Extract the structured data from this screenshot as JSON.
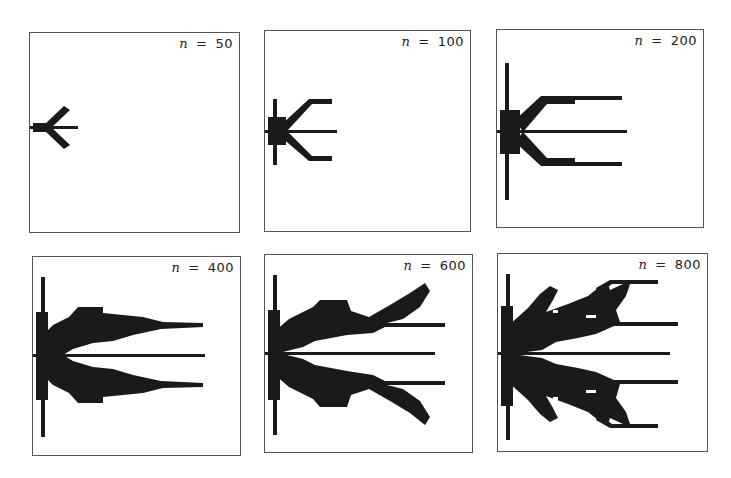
{
  "figure": {
    "ink_color": "#1a1a1a",
    "panels": [
      {
        "label_var": "n",
        "label_eq": "=",
        "label_value": "50",
        "box": {
          "x": 29,
          "y": 32,
          "w": 211,
          "h": 201
        },
        "shapes": [
          {
            "type": "rect",
            "x": 0,
            "y": 93,
            "w": 48,
            "h": 3
          },
          {
            "type": "rect",
            "x": 3,
            "y": 90,
            "w": 14,
            "h": 9
          },
          {
            "type": "poly",
            "pts": "14,92 34,73 40,77 20,96"
          },
          {
            "type": "poly",
            "pts": "14,97 34,116 40,112 20,93"
          }
        ]
      },
      {
        "label_var": "n",
        "label_eq": "=",
        "label_value": "100",
        "box": {
          "x": 264,
          "y": 30,
          "w": 207,
          "h": 202
        },
        "shapes": [
          {
            "type": "rect",
            "x": 0,
            "y": 99,
            "w": 72,
            "h": 3
          },
          {
            "type": "rect",
            "x": 8,
            "y": 68,
            "w": 4,
            "h": 66
          },
          {
            "type": "rect",
            "x": 3,
            "y": 86,
            "w": 18,
            "h": 28
          },
          {
            "type": "poly",
            "pts": "16,94 44,68 67,68 67,73 47,73 22,100"
          },
          {
            "type": "poly",
            "pts": "16,106 44,130 67,130 67,125 47,125 22,100"
          }
        ]
      },
      {
        "label_var": "n",
        "label_eq": "=",
        "label_value": "200",
        "box": {
          "x": 496,
          "y": 29,
          "w": 208,
          "h": 199
        },
        "shapes": [
          {
            "type": "rect",
            "x": 0,
            "y": 100,
            "w": 130,
            "h": 3
          },
          {
            "type": "rect",
            "x": 8,
            "y": 33,
            "w": 4,
            "h": 137
          },
          {
            "type": "rect",
            "x": 3,
            "y": 80,
            "w": 20,
            "h": 44
          },
          {
            "type": "poly",
            "pts": "18,90 44,66 125,66 125,70 78,70 78,74 50,74 26,102"
          },
          {
            "type": "poly",
            "pts": "18,112 44,136 125,136 125,132 78,132 78,128 50,128 26,102"
          }
        ]
      },
      {
        "label_var": "n",
        "label_eq": "=",
        "label_value": "400",
        "box": {
          "x": 32,
          "y": 256,
          "w": 209,
          "h": 200
        },
        "shapes": [
          {
            "type": "rect",
            "x": 0,
            "y": 97,
            "w": 172,
            "h": 3
          },
          {
            "type": "rect",
            "x": 8,
            "y": 20,
            "w": 4,
            "h": 160
          },
          {
            "type": "rect",
            "x": 3,
            "y": 55,
            "w": 12,
            "h": 88
          },
          {
            "type": "poly",
            "pts": "10,78 20,68 36,60 45,50 70,50 70,56 110,60 130,65 170,66 170,70 128,72 100,78 80,84 60,86 40,92 30,98 12,98"
          },
          {
            "type": "poly",
            "pts": "10,118 20,128 36,136 45,146 70,146 70,140 110,136 130,131 170,130 170,126 128,124 100,118 80,112 60,110 40,104 30,98 12,98"
          }
        ]
      },
      {
        "label_var": "n",
        "label_eq": "=",
        "label_value": "600",
        "box": {
          "x": 264,
          "y": 254,
          "w": 209,
          "h": 199
        },
        "shapes": [
          {
            "type": "rect",
            "x": 0,
            "y": 97,
            "w": 170,
            "h": 3
          },
          {
            "type": "rect",
            "x": 8,
            "y": 20,
            "w": 4,
            "h": 160
          },
          {
            "type": "rect",
            "x": 3,
            "y": 55,
            "w": 12,
            "h": 90
          },
          {
            "type": "poly",
            "pts": "10,76 24,64 48,52 55,45 82,45 86,56 104,62 125,50 145,38 160,28 165,36 155,52 138,64 122,68 180,68 180,72 120,72 108,78 82,80 50,86 38,92 14,98"
          },
          {
            "type": "poly",
            "pts": "10,120 24,132 48,144 55,152 82,152 86,140 104,134 125,146 145,158 160,170 165,162 155,146 138,134 122,130 180,130 180,126 120,126 108,120 82,116 50,110 38,104 14,98"
          }
        ]
      },
      {
        "label_var": "n",
        "label_eq": "=",
        "label_value": "800",
        "box": {
          "x": 497,
          "y": 253,
          "w": 211,
          "h": 199
        },
        "shapes": [
          {
            "type": "rect",
            "x": 0,
            "y": 98,
            "w": 172,
            "h": 3
          },
          {
            "type": "rect",
            "x": 8,
            "y": 20,
            "w": 4,
            "h": 166
          },
          {
            "type": "rect",
            "x": 3,
            "y": 52,
            "w": 12,
            "h": 100
          },
          {
            "type": "poly",
            "pts": "10,72 30,54 42,40 52,32 60,36 55,46 48,58 70,50 90,42 100,34 110,30 112,36 125,30 135,26 160,26 160,30 132,30 128,42 118,56 122,68 180,68 180,72 116,72 98,80 80,84 58,88 44,96 14,100"
          },
          {
            "type": "poly",
            "pts": "10,128 30,146 42,160 52,168 60,164 55,154 48,142 70,150 90,158 100,166 110,170 112,164 125,170 135,174 160,174 160,170 132,170 128,158 118,144 122,130 180,130 180,126 116,126 98,118 80,114 58,110 44,104 14,100"
          },
          {
            "type": "poly",
            "pts": "98,34 112,26 135,26 135,30 114,30 100,40"
          },
          {
            "type": "poly",
            "pts": "98,166 112,174 135,174 135,170 114,170 100,160"
          }
        ],
        "holes": [
          {
            "x": 55,
            "y": 56,
            "w": 5,
            "h": 3
          },
          {
            "x": 88,
            "y": 61,
            "w": 10,
            "h": 3
          },
          {
            "x": 55,
            "y": 143,
            "w": 5,
            "h": 3
          },
          {
            "x": 88,
            "y": 136,
            "w": 10,
            "h": 3
          }
        ]
      }
    ]
  }
}
